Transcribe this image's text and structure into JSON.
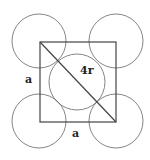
{
  "diagram": {
    "labels": {
      "side_left": "a",
      "side_bottom": "a",
      "diagonal": "4r"
    },
    "colors": {
      "stroke": "#555555",
      "square": "#444444",
      "text": "#222222",
      "background": "#ffffff"
    },
    "square": {
      "x": 40,
      "y": 42,
      "width": 76,
      "height": 80
    },
    "circles": [
      {
        "name": "top-left",
        "cx": 39,
        "cy": 41,
        "r": 27
      },
      {
        "name": "top-right",
        "cx": 116,
        "cy": 41,
        "r": 27
      },
      {
        "name": "center",
        "cx": 77,
        "cy": 82,
        "r": 28
      },
      {
        "name": "bottom-left",
        "cx": 39,
        "cy": 121,
        "r": 27
      },
      {
        "name": "bottom-right",
        "cx": 116,
        "cy": 121,
        "r": 27
      }
    ],
    "diagonal": {
      "x1": 40,
      "y1": 42,
      "x2": 116,
      "y2": 122
    }
  }
}
